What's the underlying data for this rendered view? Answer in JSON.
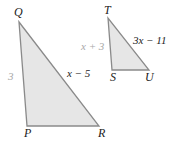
{
  "diagram": {
    "type": "similar-triangles",
    "colors": {
      "fill": "#e6e6e6",
      "stroke": "#8a8a8a",
      "label": "#222222",
      "light_label": "#a8a8a8"
    },
    "triangle_pqr": {
      "vertices": {
        "Q": "Q",
        "P": "P",
        "R": "R"
      },
      "sides": {
        "QP": "3",
        "QR": "x − 5"
      }
    },
    "triangle_tsu": {
      "vertices": {
        "T": "T",
        "S": "S",
        "U": "U"
      },
      "sides": {
        "TS": "x + 3",
        "TU": "3x − 11"
      }
    }
  }
}
